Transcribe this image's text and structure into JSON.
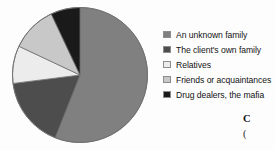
{
  "chart_data": {
    "type": "pie",
    "title": "",
    "subtitle": "",
    "xlabel": "",
    "ylabel": "",
    "grid": false,
    "legend_position": "right",
    "start_angle_deg": 0,
    "direction": "clockwise",
    "categories": [
      "An unknown family",
      "The client's own family",
      "Relatives",
      "Friends or acquaintances",
      "Drug dealers, the mafia"
    ],
    "values": [
      56,
      17,
      9,
      11,
      7
    ],
    "slices": [
      {
        "label": "An unknown family",
        "value": 56,
        "color": "#808080",
        "start_deg": 0,
        "end_deg": 201.6
      },
      {
        "label": "The client's own family",
        "value": 17,
        "color": "#4d4d4d",
        "start_deg": 201.6,
        "end_deg": 262.8
      },
      {
        "label": "Relatives",
        "value": 9,
        "color": "#ececec",
        "start_deg": 262.8,
        "end_deg": 295.2
      },
      {
        "label": "Friends or acquaintances",
        "value": 11,
        "color": "#c8c8c8",
        "start_deg": 295.2,
        "end_deg": 334.8
      },
      {
        "label": "Drug dealers, the mafia",
        "value": 7,
        "color": "#1a1a1a",
        "start_deg": 334.8,
        "end_deg": 360
      }
    ],
    "outline_color": "#6f6f6f"
  },
  "legend": {
    "items": [
      {
        "label": "An unknown family",
        "color": "#808080"
      },
      {
        "label": "The client's own family",
        "color": "#4d4d4d"
      },
      {
        "label": "Relatives",
        "color": "#ececec"
      },
      {
        "label": "Friends or acquaintances",
        "color": "#c8c8c8"
      },
      {
        "label": "Drug dealers, the mafia",
        "color": "#1a1a1a"
      }
    ]
  },
  "caption": {
    "line_1": "C",
    "line_2": "("
  }
}
